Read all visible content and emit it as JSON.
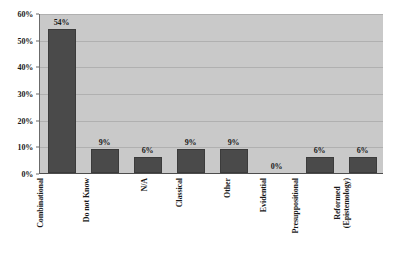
{
  "chart_data": {
    "type": "bar",
    "title": "",
    "subtitle": "",
    "xlabel": "",
    "ylabel": "",
    "categories": [
      "Combinational",
      "Do not Know",
      "N/A",
      "Classical",
      "Other",
      "Evidential",
      "Presuppositional",
      "Reformed (Epistemology)"
    ],
    "category_lines": [
      [
        "Combinational"
      ],
      [
        "Do not Know"
      ],
      [
        "N/A"
      ],
      [
        "Classical"
      ],
      [
        "Other"
      ],
      [
        "Evidential"
      ],
      [
        "Presuppositional"
      ],
      [
        "Reformed",
        "(Epistemology)"
      ]
    ],
    "values": [
      54,
      9,
      6,
      9,
      9,
      0,
      6,
      6
    ],
    "value_labels": [
      "54%",
      "9%",
      "6%",
      "9%",
      "9%",
      "0%",
      "6%",
      "6%"
    ],
    "ylim": [
      0,
      60
    ],
    "ytick_values": [
      0,
      10,
      20,
      30,
      40,
      50,
      60
    ],
    "ytick_labels": [
      "0%",
      "10%",
      "20%",
      "30%",
      "40%",
      "50%",
      "60%"
    ],
    "grid": true,
    "grid_axis": "y",
    "legend": false,
    "legend_position": "none",
    "colors": {
      "bar_fill": "#4a4a4a",
      "bar_edge": "#3b3b3b",
      "plot_background": "#c9c9c9",
      "figure_background": "#ffffff",
      "gridline": "#b0b0b0",
      "axis_line": "#4d4d4d",
      "text": "#1a1a1a"
    }
  }
}
